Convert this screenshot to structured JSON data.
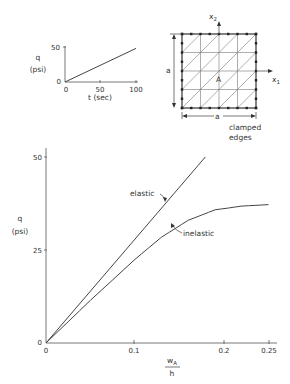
{
  "colors": {
    "ink": "#333333",
    "axis": "#555555",
    "background": "#ffffff"
  },
  "chart_data": [
    {
      "name": "load-history-inset",
      "type": "line",
      "xlabel": "t (sec)",
      "ylabel_top": "q",
      "ylabel_bottom": "(psi)",
      "xticks": [
        "0",
        "50",
        "100"
      ],
      "yticks": [
        "0",
        "50"
      ],
      "xlim": [
        0,
        100
      ],
      "ylim": [
        0,
        50
      ],
      "series": [
        {
          "name": "load",
          "x": [
            0,
            100
          ],
          "values": [
            0,
            48
          ]
        }
      ]
    },
    {
      "name": "plate-mesh-diagram",
      "type": "diagram",
      "axis_x": "x",
      "axis_x_sub": "1",
      "axis_y": "x",
      "axis_y_sub": "2",
      "point_label": "A",
      "dim_horizontal": "a",
      "dim_vertical": "a",
      "note_line1": "clamped",
      "note_line2": "edges",
      "grid_divisions": 4
    },
    {
      "name": "main-response",
      "type": "line",
      "xlabel_num": "w",
      "xlabel_num_sub": "A",
      "xlabel_den": "h",
      "ylabel_top": "q",
      "ylabel_bottom": "(psi)",
      "xticks": [
        "0",
        "0.1",
        "0.2",
        "0.25"
      ],
      "yticks": [
        "0",
        "25",
        "50"
      ],
      "xlim": [
        0,
        0.26
      ],
      "ylim": [
        0,
        55
      ],
      "series": [
        {
          "name": "elastic",
          "x": [
            0,
            0.179
          ],
          "values": [
            0,
            50
          ]
        },
        {
          "name": "inelastic",
          "x": [
            0,
            0.05,
            0.1,
            0.13,
            0.16,
            0.19,
            0.22,
            0.25
          ],
          "values": [
            0,
            11.5,
            22.5,
            28.5,
            33,
            35.8,
            36.8,
            37.2
          ]
        }
      ],
      "annotations": [
        "elastic",
        "inelastic"
      ]
    }
  ]
}
